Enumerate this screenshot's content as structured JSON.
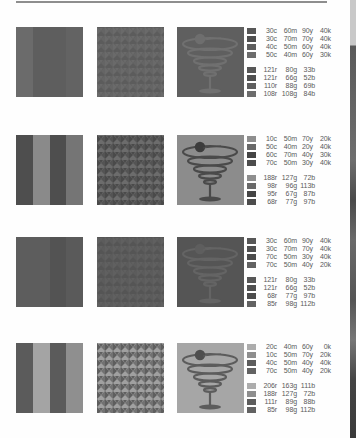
{
  "page": {
    "background": "#fefefe",
    "rule_color": "#8e8e8e"
  },
  "palettes": [
    {
      "stripes": [
        "#6b6b6b",
        "#5e5e5e",
        "#5e5e5e",
        "#636363"
      ],
      "pattern": {
        "bg": "#5c5c5c",
        "fg": "#6a6a6a"
      },
      "glass": {
        "bg": "#5f5f5f",
        "line": "#707070",
        "olive": "#6e6e6e"
      },
      "cmyk": [
        {
          "c": "30c",
          "m": "60m",
          "y": "90y",
          "k": "40k",
          "chip": "#575757"
        },
        {
          "c": "30c",
          "m": "70m",
          "y": "70y",
          "k": "40k",
          "chip": "#4f4f4f"
        },
        {
          "c": "40c",
          "m": "50m",
          "y": "60y",
          "k": "40k",
          "chip": "#5e5e5e"
        },
        {
          "c": "50c",
          "m": "40m",
          "y": "60y",
          "k": "30k",
          "chip": "#6c6c6c"
        }
      ],
      "rgb": [
        {
          "r": "121r",
          "g": "80g",
          "b": "33b",
          "chip": "#575757"
        },
        {
          "r": "121r",
          "g": "66g",
          "b": "52b",
          "chip": "#4f4f4f"
        },
        {
          "r": "110r",
          "g": "88g",
          "b": "69b",
          "chip": "#5e5e5e"
        },
        {
          "r": "108r",
          "g": "108g",
          "b": "84b",
          "chip": "#6c6c6c"
        }
      ]
    },
    {
      "stripes": [
        "#4e4e4e",
        "#8a8a8a",
        "#4e4e4e",
        "#757575"
      ],
      "pattern": {
        "bg": "#6c6c6c",
        "fg": "#4a4a4a"
      },
      "glass": {
        "bg": "#8c8c8c",
        "line": "#4a4a4a",
        "olive": "#3c3c3c"
      },
      "cmyk": [
        {
          "c": "10c",
          "m": "50m",
          "y": "70y",
          "k": "20k",
          "chip": "#8e8e8e"
        },
        {
          "c": "50c",
          "m": "40m",
          "y": "20y",
          "k": "40k",
          "chip": "#686868"
        },
        {
          "c": "60c",
          "m": "70m",
          "y": "40y",
          "k": "30k",
          "chip": "#444444"
        },
        {
          "c": "70c",
          "m": "50m",
          "y": "30y",
          "k": "40k",
          "chip": "#4c4c4c"
        }
      ],
      "rgb": [
        {
          "r": "188r",
          "g": "127g",
          "b": "72b",
          "chip": "#8e8e8e"
        },
        {
          "r": "98r",
          "g": "96g",
          "b": "113b",
          "chip": "#686868"
        },
        {
          "r": "95r",
          "g": "67g",
          "b": "87b",
          "chip": "#444444"
        },
        {
          "r": "68r",
          "g": "77g",
          "b": "97b",
          "chip": "#4c4c4c"
        }
      ]
    },
    {
      "stripes": [
        "#5d5d5d",
        "#5d5d5d",
        "#535353",
        "#5a5a5a"
      ],
      "pattern": {
        "bg": "#555555",
        "fg": "#606060"
      },
      "glass": {
        "bg": "#555555",
        "line": "#646464",
        "olive": "#5e5e5e"
      },
      "cmyk": [
        {
          "c": "30c",
          "m": "60m",
          "y": "90y",
          "k": "40k",
          "chip": "#575757"
        },
        {
          "c": "30c",
          "m": "70m",
          "y": "70y",
          "k": "40k",
          "chip": "#4f4f4f"
        },
        {
          "c": "70c",
          "m": "50m",
          "y": "30y",
          "k": "40k",
          "chip": "#4c4c4c"
        },
        {
          "c": "70c",
          "m": "50m",
          "y": "40y",
          "k": "20k",
          "chip": "#626262"
        }
      ],
      "rgb": [
        {
          "r": "121r",
          "g": "80g",
          "b": "33b",
          "chip": "#575757"
        },
        {
          "r": "121r",
          "g": "66g",
          "b": "52b",
          "chip": "#4f4f4f"
        },
        {
          "r": "68r",
          "g": "77g",
          "b": "97b",
          "chip": "#4c4c4c"
        },
        {
          "r": "85r",
          "g": "98g",
          "b": "112b",
          "chip": "#626262"
        }
      ]
    },
    {
      "stripes": [
        "#5b5b5b",
        "#a4a4a4",
        "#5b5b5b",
        "#8f8f8f"
      ],
      "pattern": {
        "bg": "#a0a0a0",
        "fg": "#5e5e5e"
      },
      "glass": {
        "bg": "#a6a6a6",
        "line": "#5c5c5c",
        "olive": "#4e4e4e"
      },
      "cmyk": [
        {
          "c": "20c",
          "m": "40m",
          "y": "60y",
          "k": "0k",
          "chip": "#acacac"
        },
        {
          "c": "10c",
          "m": "50m",
          "y": "70y",
          "k": "20k",
          "chip": "#8e8e8e"
        },
        {
          "c": "40c",
          "m": "50m",
          "y": "40y",
          "k": "40k",
          "chip": "#5c5c5c"
        },
        {
          "c": "70c",
          "m": "50m",
          "y": "40y",
          "k": "20k",
          "chip": "#626262"
        }
      ],
      "rgb": [
        {
          "r": "206r",
          "g": "163g",
          "b": "111b",
          "chip": "#acacac"
        },
        {
          "r": "188r",
          "g": "127g",
          "b": "72b",
          "chip": "#8e8e8e"
        },
        {
          "r": "111r",
          "g": "89g",
          "b": "88b",
          "chip": "#5c5c5c"
        },
        {
          "r": "85r",
          "g": "98g",
          "b": "112b",
          "chip": "#626262"
        }
      ]
    }
  ]
}
